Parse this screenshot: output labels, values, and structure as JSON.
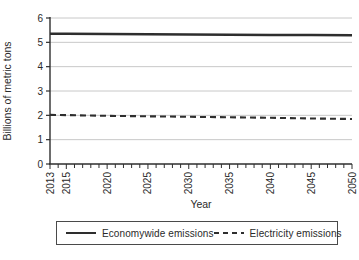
{
  "chart_data": {
    "type": "line",
    "title": "",
    "xlabel": "Year",
    "ylabel": "Billions of metric tons",
    "x_range": [
      2013,
      2050
    ],
    "x_tick_labels": [
      "2013",
      "2015",
      "2020",
      "2025",
      "2030",
      "2035",
      "2040",
      "2045",
      "2050"
    ],
    "x_labeled_ticks": [
      2013,
      2015,
      2020,
      2025,
      2030,
      2035,
      2040,
      2045,
      2050
    ],
    "minor_x_tick_every": 1,
    "ylim": [
      0,
      6
    ],
    "y_ticks": [
      0,
      1,
      2,
      3,
      4,
      5,
      6
    ],
    "grid": "horizontal",
    "legend_position": "bottom-boxed",
    "series": [
      {
        "name": "Economywide emissions",
        "style": "solid",
        "color": "#2e2e2e",
        "x": [
          2013,
          2015,
          2020,
          2025,
          2030,
          2035,
          2040,
          2045,
          2050
        ],
        "values": [
          5.35,
          5.35,
          5.34,
          5.33,
          5.32,
          5.31,
          5.3,
          5.3,
          5.29
        ]
      },
      {
        "name": "Electricity emissions",
        "style": "dashed",
        "color": "#2e2e2e",
        "x": [
          2013,
          2015,
          2020,
          2025,
          2030,
          2035,
          2040,
          2045,
          2050
        ],
        "values": [
          2.02,
          2.01,
          1.98,
          1.96,
          1.94,
          1.92,
          1.9,
          1.87,
          1.85
        ]
      }
    ],
    "colors": {
      "grid": "#c8c8c8",
      "axis": "#2e2e2e",
      "text": "#2a2a2a"
    }
  }
}
